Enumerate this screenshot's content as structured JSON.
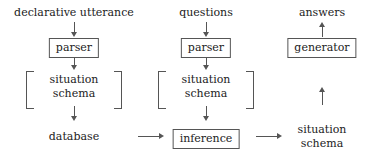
{
  "diagram": {
    "type": "flowchart",
    "title": "",
    "columns": [
      {
        "id": "left",
        "nodes": [
          {
            "id": "declarative-utterance",
            "label": "declarative utterance",
            "shape": "plain"
          },
          {
            "id": "parser-left",
            "label": "parser",
            "shape": "boxed"
          },
          {
            "id": "situation-schema-left",
            "label_line1": "situation",
            "label_line2": "schema",
            "shape": "bracketed"
          },
          {
            "id": "database",
            "label": "database",
            "shape": "plain"
          }
        ]
      },
      {
        "id": "middle",
        "nodes": [
          {
            "id": "questions",
            "label": "questions",
            "shape": "plain"
          },
          {
            "id": "parser-middle",
            "label": "parser",
            "shape": "boxed"
          },
          {
            "id": "situation-schema-middle",
            "label_line1": "situation",
            "label_line2": "schema",
            "shape": "bracketed"
          },
          {
            "id": "inference",
            "label": "inference",
            "shape": "boxed"
          }
        ]
      },
      {
        "id": "right",
        "nodes": [
          {
            "id": "answers",
            "label": "answers",
            "shape": "plain"
          },
          {
            "id": "generator",
            "label": "generator",
            "shape": "boxed"
          },
          {
            "id": "situation-schema-right",
            "label_line1": "situation",
            "label_line2": "schema",
            "shape": "plain"
          }
        ]
      }
    ],
    "arrows": [
      {
        "id": "arrow-utterance-to-parser",
        "direction": "down",
        "glyph": "↓"
      },
      {
        "id": "arrow-parser-to-schema-left",
        "direction": "down",
        "glyph": "↓"
      },
      {
        "id": "arrow-schema-to-database",
        "direction": "down",
        "glyph": "↓"
      },
      {
        "id": "arrow-questions-to-parser",
        "direction": "down",
        "glyph": "↓"
      },
      {
        "id": "arrow-parser-to-schema-middle",
        "direction": "down",
        "glyph": "↓"
      },
      {
        "id": "arrow-schema-to-inference",
        "direction": "down",
        "glyph": "↓"
      },
      {
        "id": "arrow-generator-to-answers",
        "direction": "up",
        "glyph": "↑"
      },
      {
        "id": "arrow-schema-right-to-generator",
        "direction": "up",
        "glyph": "↑"
      },
      {
        "id": "arrow-database-to-inference",
        "direction": "right",
        "glyph": "→"
      },
      {
        "id": "arrow-inference-to-schema-right",
        "direction": "right",
        "glyph": "→"
      }
    ],
    "colors": {
      "text": "#222222",
      "stroke": "#555555",
      "background": "#ffffff"
    }
  }
}
